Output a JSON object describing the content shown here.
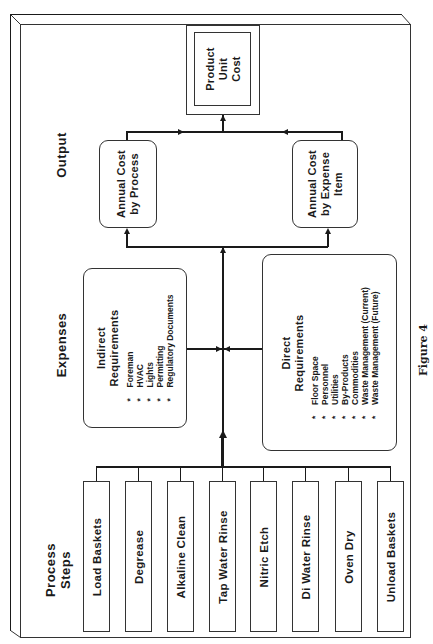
{
  "column_headers": {
    "output": "Output",
    "expenses": "Expenses",
    "process_steps_line1": "Process",
    "process_steps_line2": "Steps"
  },
  "product_unit_cost": {
    "line1": "Product",
    "line2": "Unit",
    "line3": "Cost"
  },
  "annual_cost_by_process": {
    "line1": "Annual Cost",
    "line2": "by Process"
  },
  "annual_cost_by_expense": {
    "line1": "Annual Cost",
    "line2": "by Expense",
    "line3": "Item"
  },
  "indirect_requirements": {
    "title_line1": "Indirect",
    "title_line2": "Requirements",
    "bullet": "*",
    "items": [
      "Foreman",
      "HVAC",
      "Lights",
      "Permitting",
      "Regulatory Documents"
    ]
  },
  "direct_requirements": {
    "title_line1": "Direct",
    "title_line2": "Requirements",
    "bullet": "*",
    "items": [
      "Floor Space",
      "Personnel",
      "Utilities",
      "By-Products",
      "Commodities",
      "Waste Management (Current)",
      "Waste Management (Future)"
    ]
  },
  "process_steps": [
    "Load Baskets",
    "Degrease",
    "Alkaline Clean",
    "Tap Water Rinse",
    "Nitric Etch",
    "Di Water Rinse",
    "Oven Dry",
    "Unload Baskets"
  ],
  "caption": "Figure 4",
  "colors": {
    "line": "#1a1a1a",
    "border": "#333333",
    "background": "#ffffff"
  }
}
